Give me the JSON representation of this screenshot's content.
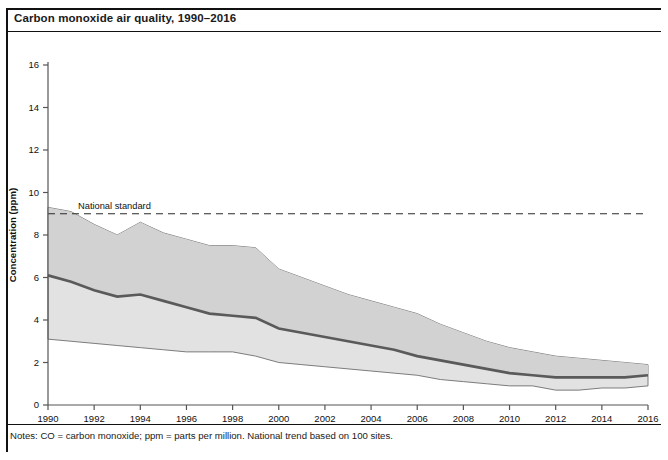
{
  "figure": {
    "title": "Carbon monoxide air quality, 1990–2016",
    "notes": "Notes: CO = carbon monoxide; ppm = parts per million. National trend based on 100 sites."
  },
  "colors": {
    "band_outer": "#e2e2e2",
    "band_inner": "#d2d2d2",
    "mean_line": "#5a5a5a",
    "band_edge": "#6f6f6f",
    "standard_line": "#2b2b2b",
    "axis": "#555555",
    "text": "#1a1a1a",
    "background": "#ffffff"
  },
  "chart_data": {
    "type": "area",
    "title": "Carbon monoxide air quality, 1990–2016",
    "subtitle": "1990 to 2016: 77% decrease in national average",
    "xlabel": "",
    "ylabel": "Concentration (ppm)",
    "xlim": [
      1990,
      2016
    ],
    "ylim": [
      0,
      16
    ],
    "yticks": [
      0,
      2,
      4,
      6,
      8,
      10,
      12,
      14,
      16
    ],
    "xticks": [
      1990,
      1992,
      1994,
      1996,
      1998,
      2000,
      2002,
      2004,
      2006,
      2008,
      2010,
      2012,
      2014,
      2016
    ],
    "xtick_labels": [
      "1990",
      "1992",
      "1994",
      "1996",
      "1998",
      "2000",
      "2002",
      "2004",
      "2006",
      "2008",
      "2010",
      "2012",
      "2014",
      "2016"
    ],
    "grid": false,
    "legend": "none",
    "x": [
      1990,
      1991,
      1992,
      1993,
      1994,
      1995,
      1996,
      1997,
      1998,
      1999,
      2000,
      2001,
      2002,
      2003,
      2004,
      2005,
      2006,
      2007,
      2008,
      2009,
      2010,
      2011,
      2012,
      2013,
      2014,
      2015,
      2016
    ],
    "series": [
      {
        "name": "90th percentile",
        "role": "band_upper",
        "values": [
          9.3,
          9.1,
          8.5,
          8.0,
          8.6,
          8.1,
          7.8,
          7.5,
          7.5,
          7.4,
          6.4,
          6.0,
          5.6,
          5.2,
          4.9,
          4.6,
          4.3,
          3.8,
          3.4,
          3.0,
          2.7,
          2.5,
          2.3,
          2.2,
          2.1,
          2.0,
          1.9
        ]
      },
      {
        "name": "Mean (national average)",
        "role": "mean",
        "values": [
          6.1,
          5.8,
          5.4,
          5.1,
          5.2,
          4.9,
          4.6,
          4.3,
          4.2,
          4.1,
          3.6,
          3.4,
          3.2,
          3.0,
          2.8,
          2.6,
          2.3,
          2.1,
          1.9,
          1.7,
          1.5,
          1.4,
          1.3,
          1.3,
          1.3,
          1.3,
          1.4
        ]
      },
      {
        "name": "10th percentile",
        "role": "band_lower",
        "values": [
          3.1,
          3.0,
          2.9,
          2.8,
          2.7,
          2.6,
          2.5,
          2.5,
          2.5,
          2.3,
          2.0,
          1.9,
          1.8,
          1.7,
          1.6,
          1.5,
          1.4,
          1.2,
          1.1,
          1.0,
          0.9,
          0.9,
          0.7,
          0.7,
          0.8,
          0.8,
          0.9
        ]
      }
    ],
    "annotations": [
      {
        "label": "National standard",
        "type": "hline",
        "y": 9,
        "style": "dashed"
      }
    ]
  },
  "axis": {
    "y_title": "Concentration (ppm)",
    "subtitle": "1990 to 2016: 77% decrease in national average",
    "standard_label": "National standard"
  }
}
